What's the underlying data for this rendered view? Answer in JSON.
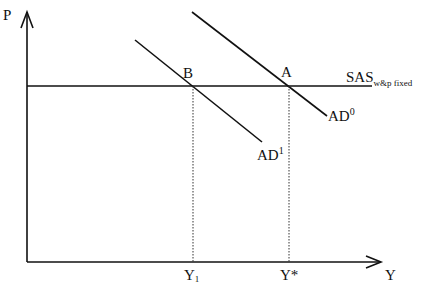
{
  "diagram": {
    "type": "economics-ad-sas",
    "axes": {
      "y_label": "P",
      "x_label": "Y"
    },
    "curves": {
      "sas": {
        "label": "SAS",
        "subscript": "w&p fixed"
      },
      "ad0": {
        "label": "AD",
        "superscript": "0"
      },
      "ad1": {
        "label": "AD",
        "superscript": "1"
      }
    },
    "points": {
      "a": {
        "label": "A"
      },
      "b": {
        "label": "B"
      }
    },
    "x_ticks": {
      "y1": {
        "label": "Y",
        "subscript": "1"
      },
      "ystar": {
        "label": "Y*"
      }
    },
    "colors": {
      "line": "#111111",
      "background": "#ffffff"
    }
  }
}
